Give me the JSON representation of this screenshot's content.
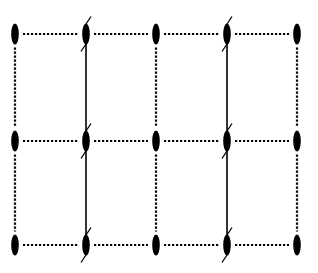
{
  "diagram": {
    "type": "lattice",
    "columns_x": [
      15,
      86,
      156,
      227,
      297
    ],
    "rows_y": [
      34,
      141,
      245
    ],
    "node": {
      "shape": "ellipse",
      "rx": 3.8,
      "ry": 10.5,
      "color": "#000000"
    },
    "dotted_edge": {
      "color": "#000000",
      "dot_spacing": 4,
      "dot_size": 2.2
    },
    "solid_columns": [
      1,
      3
    ],
    "solid_line": {
      "color": "#000000",
      "width": 1.6,
      "y_top": 24,
      "y_bottom": 250
    },
    "tick_marks": {
      "length": 10,
      "angle_deg": -55
    }
  }
}
